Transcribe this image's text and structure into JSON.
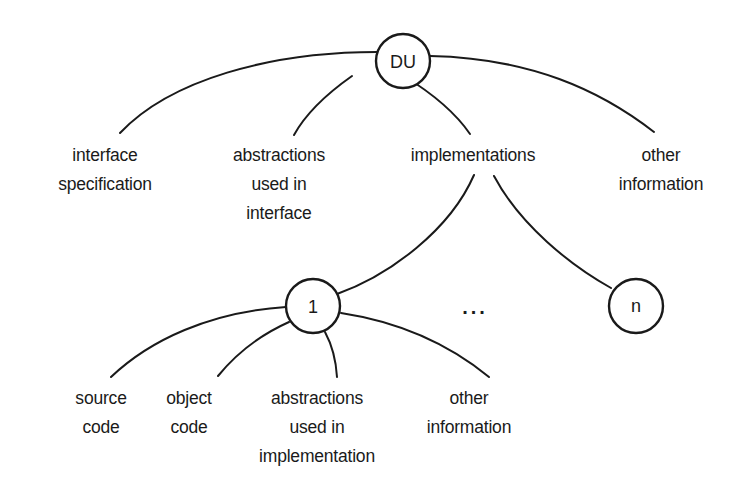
{
  "diagram": {
    "type": "tree",
    "root": {
      "label": "DU",
      "children": [
        {
          "label_lines": [
            "interface",
            "specification"
          ]
        },
        {
          "label_lines": [
            "abstractions",
            "used in",
            "interface"
          ]
        },
        {
          "label_lines": [
            "implementations"
          ]
        },
        {
          "label_lines": [
            "other",
            "information"
          ]
        }
      ]
    },
    "implementations": {
      "nodes": [
        {
          "label": "1"
        },
        {
          "label": "n"
        }
      ],
      "ellipsis": "...",
      "first_implementation_children": [
        {
          "label_lines": [
            "source",
            "code"
          ]
        },
        {
          "label_lines": [
            "object",
            "code"
          ]
        },
        {
          "label_lines": [
            "abstractions",
            "used in",
            "implementation"
          ]
        },
        {
          "label_lines": [
            "other",
            "information"
          ]
        }
      ]
    }
  }
}
